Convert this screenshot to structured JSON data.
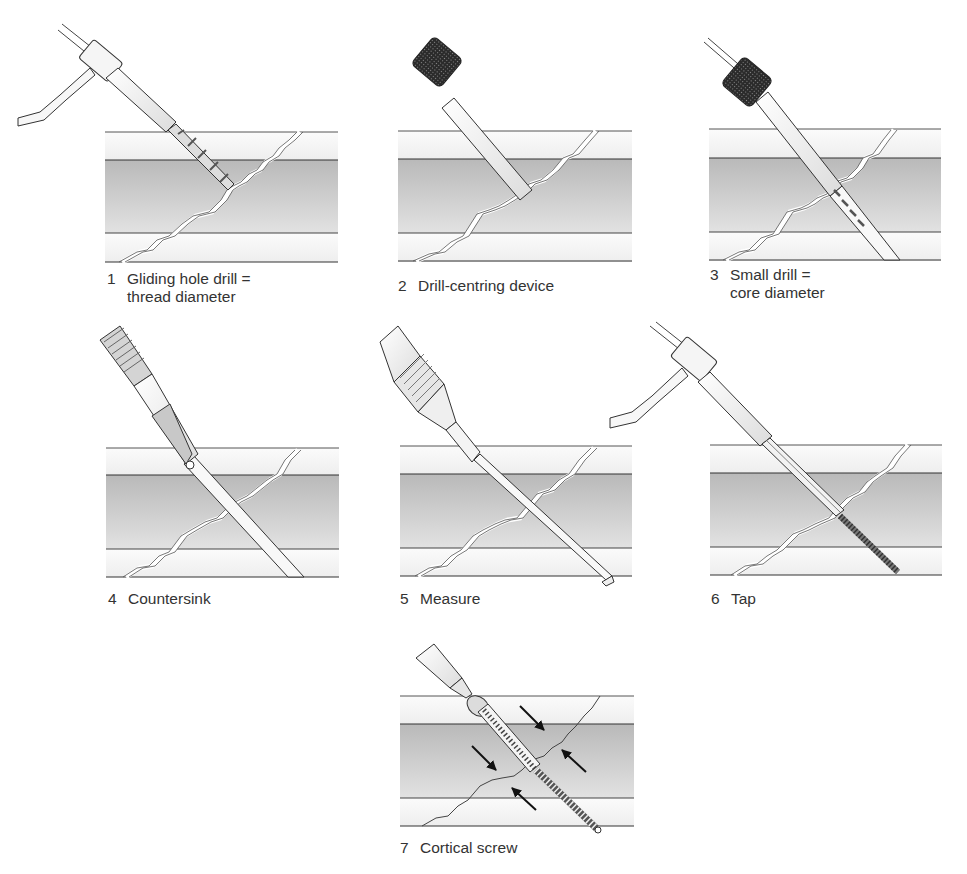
{
  "figure": {
    "colors": {
      "cortex_light": "#f1f1f1",
      "medulla_top": "#bdbdbd",
      "medulla_bottom": "#dedede",
      "line": "#3a3a3a",
      "instrument": "#f4f4f4",
      "knurl": "#2e2e2e",
      "arrow": "#1a1a1a"
    },
    "panels": [
      {
        "step": "1",
        "label_line1": "Gliding hole drill =",
        "label_line2": "thread diameter",
        "instrument": "drill-with-handle"
      },
      {
        "step": "2",
        "label_line1": "Drill-centring device",
        "label_line2": "",
        "instrument": "drill-guide-knurled"
      },
      {
        "step": "3",
        "label_line1": "Small drill =",
        "label_line2": "core diameter",
        "instrument": "small-drill-in-guide"
      },
      {
        "step": "4",
        "label_line1": "Countersink",
        "label_line2": "",
        "instrument": "countersink"
      },
      {
        "step": "5",
        "label_line1": "Measure",
        "label_line2": "",
        "instrument": "depth-gauge"
      },
      {
        "step": "6",
        "label_line1": "Tap",
        "label_line2": "",
        "instrument": "tap-with-handle"
      },
      {
        "step": "7",
        "label_line1": "Cortical screw",
        "label_line2": "",
        "instrument": "screwdriver-and-screw"
      }
    ]
  }
}
